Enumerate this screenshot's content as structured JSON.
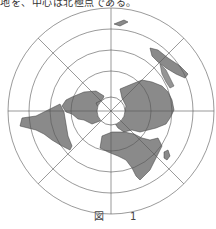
{
  "top_text": "地を、中心は北極点である。",
  "figure": {
    "label": "図　1",
    "projection": "polar azimuthal equidistant (north pole centered)",
    "center": [
      111,
      111
    ],
    "ring_radii": [
      103,
      82,
      61,
      40
    ],
    "meridian_step_deg": 45,
    "colors": {
      "land": "#8a8a8a",
      "land_stroke": "#333333",
      "grid": "#555555",
      "ocean": "#ffffff"
    }
  }
}
